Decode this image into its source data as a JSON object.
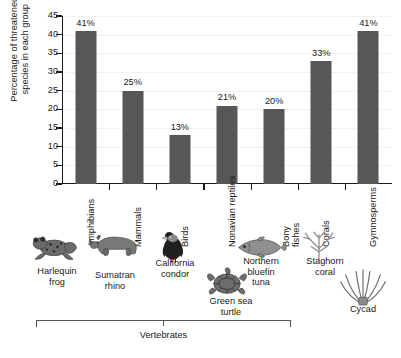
{
  "chart_data": {
    "type": "bar",
    "title": "",
    "xlabel": "",
    "ylabel": "Percentage of threatened\nspecies in each group",
    "ylabel_line1": "Percentage of threatened",
    "ylabel_line2": "species in each group",
    "ylim": [
      0,
      45
    ],
    "ytick_step": 5,
    "yticks": [
      "45",
      "40",
      "35",
      "30",
      "25",
      "20",
      "15",
      "10",
      "5",
      "0"
    ],
    "grid": true,
    "legend": "none",
    "bar_color": "#575757",
    "categories": [
      "Amphibians",
      "Mammals",
      "Birds",
      "Nonavian reptiles",
      "Bony fishes",
      "Corals",
      "Gymnosperms"
    ],
    "values": [
      41,
      25,
      13,
      21,
      20,
      33,
      41
    ],
    "value_labels": [
      "41%",
      "25%",
      "13%",
      "21%",
      "20%",
      "33%",
      "41%"
    ]
  },
  "axis": {
    "category_labels": [
      {
        "text": "Amphibians",
        "lines": [
          "Amphibians"
        ]
      },
      {
        "text": "Mammals",
        "lines": [
          "Mammals"
        ]
      },
      {
        "text": "Birds",
        "lines": [
          "Birds"
        ]
      },
      {
        "text": "Nonavian reptiles",
        "lines": [
          "Nonavian reptiles"
        ]
      },
      {
        "text": "Bony fishes",
        "lines": [
          "Bony",
          "fishes"
        ]
      },
      {
        "text": "Corals",
        "lines": [
          "Corals"
        ]
      },
      {
        "text": "Gymnosperms",
        "lines": [
          "Gymnosperms"
        ]
      }
    ]
  },
  "illustrations": [
    {
      "name": "harlequin-frog",
      "caption": "Harlequin\nfrog",
      "icon": "frog-illustration"
    },
    {
      "name": "sumatran-rhino",
      "caption": "Sumatran\nrhino",
      "icon": "rhino-illustration"
    },
    {
      "name": "california-condor",
      "caption": "California\ncondor",
      "icon": "condor-illustration"
    },
    {
      "name": "green-sea-turtle",
      "caption": "Green sea\nturtle",
      "icon": "turtle-illustration"
    },
    {
      "name": "northern-bluefin-tuna",
      "caption": "Northern\nbluefin\ntuna",
      "icon": "tuna-illustration"
    },
    {
      "name": "staghorn-coral",
      "caption": "Staghorn\ncoral",
      "icon": "coral-illustration"
    },
    {
      "name": "cycad",
      "caption": "Cycad",
      "icon": "cycad-illustration"
    }
  ],
  "bracket": {
    "label": "Vertebrates"
  }
}
